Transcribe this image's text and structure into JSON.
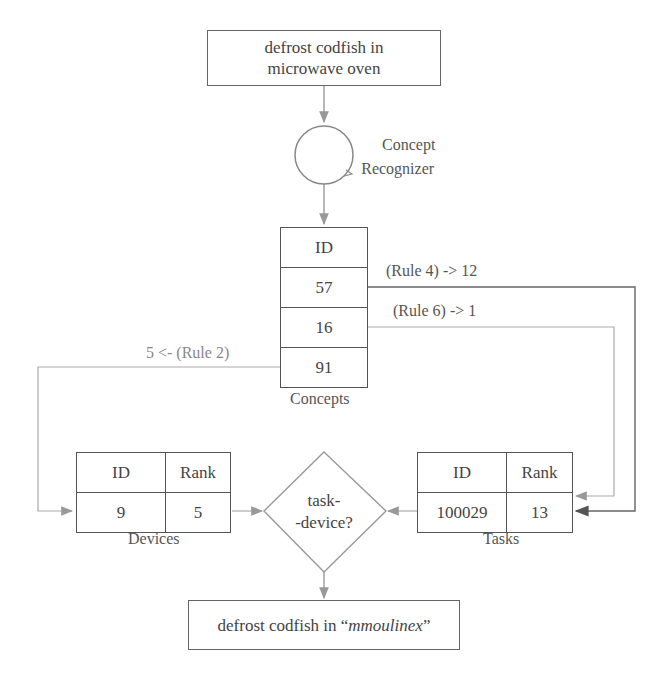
{
  "input_box": {
    "line1": "defrost codfish in",
    "line2": "microwave oven"
  },
  "recognizer": {
    "line1": "Concept",
    "line2": "Recognizer"
  },
  "concepts": {
    "header": "ID",
    "ids": [
      "57",
      "16",
      "91"
    ],
    "label": "Concepts"
  },
  "rules": {
    "rule4": "(Rule 4) -> 12",
    "rule6": "(Rule 6) -> 1",
    "rule2": "5 <- (Rule 2)"
  },
  "devices": {
    "headers": [
      "ID",
      "Rank"
    ],
    "row": [
      "9",
      "5"
    ],
    "label": "Devices"
  },
  "tasks": {
    "headers": [
      "ID",
      "Rank"
    ],
    "row": [
      "100029",
      "13"
    ],
    "label": "Tasks"
  },
  "decision": {
    "line1": "task-",
    "line2": "-device?"
  },
  "output_box": {
    "prefix": "defrost codfish in “",
    "device": "mmoulinex",
    "suffix": "”"
  },
  "colors": {
    "line_dark": "#555555",
    "line_light": "#aaaaaa",
    "text": "#444444"
  }
}
